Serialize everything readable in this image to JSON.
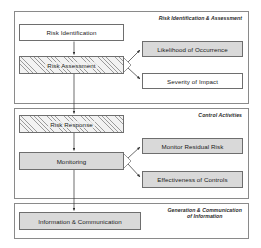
{
  "diagram": {
    "colors": {
      "panel_border": "#8a8a8a",
      "node_border": "#6e6e6e",
      "node_fill_gray": "#d9d9d9",
      "node_fill_white": "#ffffff",
      "hatch_line": "#9a9a9a",
      "connector": "#3a3a3a",
      "text": "#1a1a1a",
      "background": "#ffffff"
    },
    "panels": [
      {
        "id": "assessment",
        "title": "Risk Identification & Assessment",
        "nodes": [
          {
            "id": "risk-identification",
            "label": "Risk Identification",
            "fill": "white"
          },
          {
            "id": "risk-assessment",
            "label": "Risk Assessment",
            "fill": "hatch"
          },
          {
            "id": "likelihood",
            "label": "Likelihood of Occurrence",
            "fill": "gray"
          },
          {
            "id": "severity",
            "label": "Severity of Impact",
            "fill": "white"
          }
        ]
      },
      {
        "id": "control",
        "title": "Control Activities",
        "nodes": [
          {
            "id": "risk-response",
            "label": "Risk Response",
            "fill": "hatch"
          },
          {
            "id": "monitoring",
            "label": "Monitoring",
            "fill": "gray"
          },
          {
            "id": "monitor-residual",
            "label": "Monitor Residual Risk",
            "fill": "gray"
          },
          {
            "id": "effectiveness",
            "label": "Effectiveness of Controls",
            "fill": "gray"
          }
        ]
      },
      {
        "id": "info",
        "title": "Generation & Communication\nof Information",
        "nodes": [
          {
            "id": "information",
            "label": "Information & Communication",
            "fill": "gray"
          }
        ]
      }
    ],
    "connectors": [
      {
        "from": "risk-identification",
        "to": "risk-assessment",
        "type": "vertical-arrow"
      },
      {
        "from": "risk-assessment",
        "to": "likelihood",
        "type": "branch-arrow"
      },
      {
        "from": "risk-assessment",
        "to": "severity",
        "type": "branch-arrow"
      },
      {
        "from": "risk-assessment",
        "to": "risk-response",
        "type": "vertical-arrow"
      },
      {
        "from": "risk-response",
        "to": "monitoring",
        "type": "vertical-arrow"
      },
      {
        "from": "monitoring",
        "to": "monitor-residual",
        "type": "branch-arrow"
      },
      {
        "from": "monitoring",
        "to": "effectiveness",
        "type": "branch-arrow"
      },
      {
        "from": "monitoring",
        "to": "information",
        "type": "vertical-arrow"
      }
    ]
  }
}
